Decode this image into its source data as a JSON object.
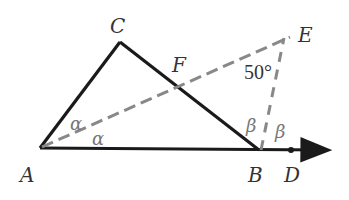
{
  "diagram": {
    "type": "geometry",
    "points": {
      "A": {
        "label": "A",
        "x": 40,
        "y": 148
      },
      "B": {
        "label": "B",
        "x": 259,
        "y": 150
      },
      "C": {
        "label": "C",
        "x": 120,
        "y": 42
      },
      "D": {
        "label": "D",
        "x": 291,
        "y": 150
      },
      "E": {
        "label": "E",
        "x": 292,
        "y": 37
      },
      "F": {
        "label": "F"
      }
    },
    "angles": {
      "alpha_top": "α",
      "alpha_bottom": "α",
      "beta_left": "β",
      "beta_right": "β",
      "angle_E": "50°"
    },
    "segments": {
      "solid": [
        "AC",
        "CB",
        "AB",
        "BD-ray"
      ],
      "dashed": [
        "AE",
        "BE"
      ]
    },
    "colors": {
      "solid_line": "#1a1a1a",
      "dashed_line": "#888888",
      "label": "#333333",
      "greek": "#777777"
    }
  }
}
